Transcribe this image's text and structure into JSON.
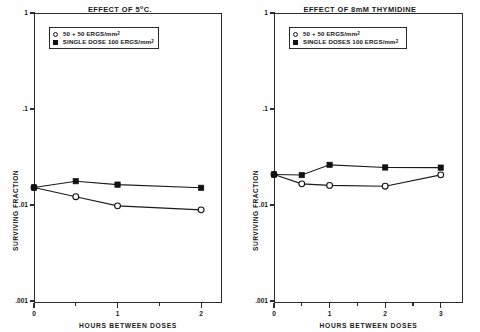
{
  "figure": {
    "axis_y_label": "SURVIVING FRACTION",
    "axis_x_label": "HOURS BETWEEN DOSES"
  },
  "chart_data": [
    {
      "type": "line",
      "title": "EFFECT OF 5°C.",
      "panel": "left",
      "xlabel": "HOURS BETWEEN DOSES",
      "ylabel": "SURVIVING FRACTION",
      "yscale": "log",
      "ylim": [
        0.001,
        1
      ],
      "yticks": [
        1,
        0.1,
        0.01,
        0.001
      ],
      "ytick_labels": [
        "1",
        ".1",
        ".01",
        ".001"
      ],
      "xlim": [
        0,
        2.25
      ],
      "xticks": [
        0,
        1,
        2
      ],
      "xtick_labels": [
        "0",
        "1",
        "2"
      ],
      "xminor_ticks": [
        0.5,
        1.5
      ],
      "grid": false,
      "legend_position": "top-center",
      "series": [
        {
          "name": "50 + 50 ERGS/mm2",
          "marker": "open-circle",
          "x": [
            0,
            0.5,
            1,
            2
          ],
          "values": [
            0.0152,
            0.0122,
            0.0098,
            0.0089
          ]
        },
        {
          "name": "SINGLE DOSE 100 ERGS/mm2",
          "marker": "filled-square",
          "x": [
            0,
            0.5,
            1,
            2
          ],
          "values": [
            0.0152,
            0.0177,
            0.0163,
            0.0151
          ]
        }
      ]
    },
    {
      "type": "line",
      "title": "EFFECT OF 8mM THYMIDINE",
      "panel": "right",
      "xlabel": "HOURS BETWEEN DOSES",
      "ylabel": "SURVIVING FRACTION",
      "yscale": "log",
      "ylim": [
        0.001,
        1
      ],
      "yticks": [
        1,
        0.1,
        0.01,
        0.001
      ],
      "ytick_labels": [
        "1",
        ".1",
        ".01",
        ".001"
      ],
      "xlim": [
        0,
        3.4
      ],
      "xticks": [
        0,
        1,
        2,
        3
      ],
      "xtick_labels": [
        "0",
        "1",
        "2",
        "3"
      ],
      "xminor_ticks": [
        0.5,
        1.5,
        2.5
      ],
      "grid": false,
      "legend_position": "top-center",
      "series": [
        {
          "name": "50 + 50 ERGS/mm2",
          "marker": "open-circle",
          "x": [
            0,
            0.5,
            1,
            2,
            3
          ],
          "values": [
            0.0208,
            0.0166,
            0.016,
            0.0157,
            0.0206
          ]
        },
        {
          "name": "SINGLE DOSES 100 ERGS/mm2",
          "marker": "filled-square",
          "x": [
            0,
            0.5,
            1,
            2,
            3
          ],
          "values": [
            0.0208,
            0.0205,
            0.0262,
            0.0246,
            0.0245
          ]
        }
      ]
    }
  ],
  "panels": [
    {
      "title_main": "EFFECT OF 5",
      "title_sup": "o",
      "title_tail": "C.",
      "legend": [
        {
          "marker": "open-circle",
          "text": "50 + 50 ERGS/mm",
          "sup": "2"
        },
        {
          "marker": "filled-square",
          "text": "SINGLE DOSE 100 ERGS/mm",
          "sup": "2"
        }
      ]
    },
    {
      "title_main": "EFFECT OF 8mM THYMIDINE",
      "title_sup": "",
      "title_tail": "",
      "legend": [
        {
          "marker": "open-circle",
          "text": "50 + 50 ERGS/mm",
          "sup": "2"
        },
        {
          "marker": "filled-square",
          "text": "SINGLE DOSES 100 ERGS/mm",
          "sup": "2"
        }
      ]
    }
  ]
}
